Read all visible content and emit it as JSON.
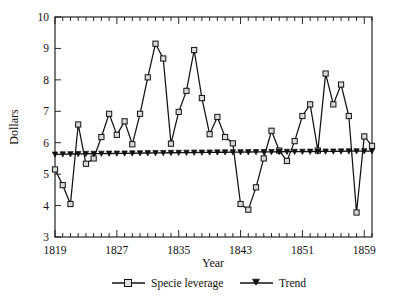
{
  "figure": {
    "background_color": "#ffffff",
    "line_color": "#111111",
    "marker_face_color": "#d9d9d9"
  },
  "chart_data": {
    "type": "line",
    "title": "",
    "xlabel": "Year",
    "ylabel": "Dollars",
    "xlim": [
      1819,
      1860
    ],
    "ylim": [
      3,
      10
    ],
    "yticks": [
      3,
      4,
      5,
      6,
      7,
      8,
      9,
      10
    ],
    "xticks": [
      1819,
      1827,
      1835,
      1843,
      1851,
      1859
    ],
    "xtick_labels": [
      "1819",
      "1827",
      "1835",
      "1843",
      "1851",
      "1859"
    ],
    "ytick_labels": [
      "3",
      "4",
      "5",
      "6",
      "7",
      "8",
      "9",
      "10"
    ],
    "minor_tick_interval": 1,
    "grid": false,
    "legend_position": "below",
    "x": [
      1819,
      1820,
      1821,
      1822,
      1823,
      1824,
      1825,
      1826,
      1827,
      1828,
      1829,
      1830,
      1831,
      1832,
      1833,
      1834,
      1835,
      1836,
      1837,
      1838,
      1839,
      1840,
      1841,
      1842,
      1843,
      1844,
      1845,
      1846,
      1847,
      1848,
      1849,
      1850,
      1851,
      1852,
      1853,
      1854,
      1855,
      1856,
      1857,
      1858,
      1859,
      1860
    ],
    "series": [
      {
        "name": "Specie leverage",
        "marker": "open-square",
        "values": [
          5.15,
          4.65,
          4.05,
          6.58,
          5.33,
          5.5,
          6.18,
          6.92,
          6.25,
          6.68,
          5.95,
          6.92,
          8.08,
          9.15,
          8.68,
          5.97,
          6.98,
          7.65,
          8.95,
          7.42,
          6.27,
          6.82,
          6.18,
          5.98,
          4.05,
          3.87,
          4.58,
          5.5,
          6.38,
          5.75,
          5.42,
          6.05,
          6.85,
          7.22,
          5.75,
          8.2,
          7.22,
          7.85,
          6.85,
          3.78,
          6.2,
          5.9
        ]
      },
      {
        "name": "Trend",
        "marker": "filled-triangle",
        "values": [
          5.63,
          5.635,
          5.64,
          5.645,
          5.65,
          5.652,
          5.655,
          5.658,
          5.66,
          5.663,
          5.666,
          5.669,
          5.672,
          5.675,
          5.678,
          5.681,
          5.684,
          5.687,
          5.69,
          5.692,
          5.694,
          5.696,
          5.698,
          5.7,
          5.702,
          5.704,
          5.706,
          5.708,
          5.71,
          5.712,
          5.714,
          5.716,
          5.718,
          5.72,
          5.722,
          5.724,
          5.726,
          5.728,
          5.73,
          5.732,
          5.734,
          5.736
        ]
      }
    ]
  },
  "legend": {
    "entries": [
      {
        "label": "Specie leverage",
        "marker": "open-square"
      },
      {
        "label": "Trend",
        "marker": "filled-triangle"
      }
    ]
  }
}
